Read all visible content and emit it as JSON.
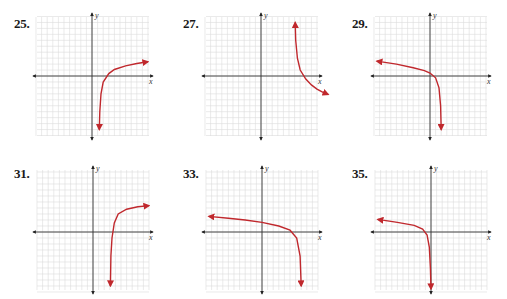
{
  "page": {
    "type": "textbook exercise graphs"
  },
  "graphs": [
    {
      "label": "25.",
      "x_axis": "x",
      "y_axis": "y",
      "description": "increasing logarithmic curve, vertical asymptote right of y-axis, heading down-left to -y and rising to the right"
    },
    {
      "label": "27.",
      "x_axis": "x",
      "y_axis": "y",
      "description": "decreasing logarithmic curve, vertical asymptote right of y-axis, coming from +y and falling to the right"
    },
    {
      "label": "29.",
      "x_axis": "x",
      "y_axis": "y",
      "description": "reflected logarithmic curve, comes from upper-left and drops to -y near x slightly right of origin"
    },
    {
      "label": "31.",
      "x_axis": "x",
      "y_axis": "y",
      "description": "increasing logarithmic curve shifted right and up, asymptote at x≈3"
    },
    {
      "label": "33.",
      "x_axis": "x",
      "y_axis": "y",
      "description": "reflected logarithmic curve from upper-left, drops to -y near x≈6"
    },
    {
      "label": "35.",
      "x_axis": "x",
      "y_axis": "y",
      "description": "reflected logarithmic curve from upper-left, drops to -y along the y-axis"
    }
  ],
  "chart_data": [
    {
      "type": "line",
      "title": "25.",
      "xlabel": "x",
      "ylabel": "y",
      "xlim": [
        -10,
        10
      ],
      "ylim": [
        -10,
        10
      ],
      "grid": true,
      "series": [
        {
          "name": "curve",
          "x": [
            1.3,
            1.4,
            1.6,
            2,
            3,
            4,
            6,
            8,
            10
          ],
          "y": [
            -9,
            -6,
            -3,
            -1,
            0.4,
            1.1,
            1.7,
            2.1,
            2.4
          ]
        }
      ],
      "asymptote_x": 1.2
    },
    {
      "type": "line",
      "title": "27.",
      "xlabel": "x",
      "ylabel": "y",
      "xlim": [
        -10,
        10
      ],
      "ylim": [
        -10,
        10
      ],
      "grid": true,
      "series": [
        {
          "name": "curve",
          "x": [
            6.1,
            6.2,
            6.5,
            7,
            8,
            9,
            10,
            11,
            12
          ],
          "y": [
            9,
            6,
            3,
            1,
            -0.5,
            -1.5,
            -2.2,
            -2.7,
            -3.1
          ]
        }
      ],
      "asymptote_x": 6
    },
    {
      "type": "line",
      "title": "29.",
      "xlabel": "x",
      "ylabel": "y",
      "xlim": [
        -10,
        10
      ],
      "ylim": [
        -10,
        10
      ],
      "grid": true,
      "series": [
        {
          "name": "curve",
          "x": [
            -9.5,
            -6,
            -3,
            -1,
            0,
            1,
            1.6,
            1.9,
            2
          ],
          "y": [
            2.5,
            2,
            1.4,
            0.9,
            0.5,
            -0.3,
            -2,
            -5,
            -9
          ]
        }
      ],
      "asymptote_x": 2
    },
    {
      "type": "line",
      "title": "31.",
      "xlabel": "x",
      "ylabel": "y",
      "xlim": [
        -10,
        10
      ],
      "ylim": [
        -10,
        10
      ],
      "grid": true,
      "series": [
        {
          "name": "curve",
          "x": [
            3.1,
            3.2,
            3.4,
            3.8,
            4.5,
            6,
            8,
            10
          ],
          "y": [
            -9,
            -4,
            -1,
            1.5,
            3,
            3.8,
            4.2,
            4.4
          ]
        }
      ],
      "asymptote_x": 3
    },
    {
      "type": "line",
      "title": "33.",
      "xlabel": "x",
      "ylabel": "y",
      "xlim": [
        -10,
        10
      ],
      "ylim": [
        -10,
        10
      ],
      "grid": true,
      "series": [
        {
          "name": "curve",
          "x": [
            -9.5,
            -6,
            -3,
            0,
            3,
            5,
            6.2,
            6.8,
            7
          ],
          "y": [
            2.6,
            2.3,
            2,
            1.6,
            1,
            0.3,
            -1,
            -4,
            -9
          ]
        }
      ],
      "asymptote_x": 7
    },
    {
      "type": "line",
      "title": "35.",
      "xlabel": "x",
      "ylabel": "y",
      "xlim": [
        -10,
        10
      ],
      "ylim": [
        -10,
        10
      ],
      "grid": true,
      "series": [
        {
          "name": "curve",
          "x": [
            -9.5,
            -6,
            -3,
            -1.5,
            -0.7,
            -0.3,
            -0.1,
            0
          ],
          "y": [
            2.1,
            1.6,
            1.1,
            0.5,
            -0.5,
            -2.5,
            -6,
            -9.5
          ]
        }
      ],
      "asymptote_x": 0
    }
  ]
}
